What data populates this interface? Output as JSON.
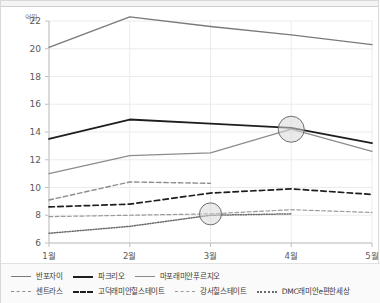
{
  "chart_data": {
    "type": "line",
    "title": "",
    "subtitle": "",
    "xlabel": "",
    "ylabel": "억원",
    "unit_label": "억원",
    "categories": [
      "1월",
      "2월",
      "3월",
      "4월",
      "5월"
    ],
    "ylim": [
      6,
      22
    ],
    "yticks": [
      6,
      8,
      10,
      12,
      14,
      16,
      18,
      20,
      22
    ],
    "ytick_labels": [
      "6",
      "8",
      "10",
      "12",
      "14",
      "16",
      "18",
      "20",
      "22"
    ],
    "grid": true,
    "legend_position": "bottom",
    "series": [
      {
        "name": "반포자이",
        "style": "solid",
        "color": "#7a7a7a",
        "width": 1.4,
        "values": [
          20.1,
          22.3,
          21.6,
          21.0,
          20.3
        ]
      },
      {
        "name": "파크리오",
        "style": "solid",
        "color": "#1e1e1e",
        "width": 1.8,
        "values": [
          13.5,
          14.9,
          14.6,
          14.3,
          13.2
        ]
      },
      {
        "name": "마포래미안푸르지오",
        "style": "solid",
        "color": "#8c8c8c",
        "width": 1.3,
        "values": [
          11.0,
          12.3,
          12.5,
          14.2,
          12.6
        ]
      },
      {
        "name": "센트라스",
        "style": "dashed",
        "color": "#8c8c8c",
        "width": 1.4,
        "values": [
          9.1,
          10.4,
          10.3,
          null,
          null
        ]
      },
      {
        "name": "고덕래미안힐스테이트",
        "style": "dashed",
        "color": "#1e1e1e",
        "width": 1.7,
        "values": [
          8.6,
          8.8,
          9.6,
          9.9,
          9.5
        ]
      },
      {
        "name": "강서힐스테이트",
        "style": "dashed",
        "color": "#9b9b9b",
        "width": 1.2,
        "values": [
          7.9,
          8.0,
          8.1,
          8.4,
          8.2
        ]
      },
      {
        "name": "DMC래미안e편한세상",
        "style": "dotted",
        "color": "#6b6b6b",
        "width": 1.5,
        "values": [
          6.7,
          7.2,
          8.0,
          8.1,
          null
        ]
      }
    ],
    "highlights": [
      {
        "series": "마포래미안푸르지오",
        "x": "4월",
        "y": 14.2,
        "radius": 13
      },
      {
        "series": "강서힐스테이트",
        "x": "3월",
        "y": 8.1,
        "radius": 11
      }
    ]
  },
  "legend": {
    "rows": [
      [
        {
          "label": "반포자이",
          "style": "solid",
          "color": "#7a7a7a",
          "width": 1.8
        },
        {
          "label": "파크리오",
          "style": "solid",
          "color": "#1e1e1e",
          "width": 2.2
        },
        {
          "label": "마포래미안푸르지오",
          "style": "solid",
          "color": "#8c8c8c",
          "width": 1.6
        }
      ],
      [
        {
          "label": "센트라스",
          "style": "dashed",
          "color": "#8c8c8c",
          "width": 1.8
        },
        {
          "label": "고덕래미안힐스테이트",
          "style": "dashed",
          "color": "#1e1e1e",
          "width": 2.2
        },
        {
          "label": "강서힐스테이트",
          "style": "dashed",
          "color": "#9b9b9b",
          "width": 1.6
        },
        {
          "label": "DMC래미안e편한세상",
          "style": "dotted",
          "color": "#6b6b6b",
          "width": 2.0
        }
      ]
    ]
  }
}
